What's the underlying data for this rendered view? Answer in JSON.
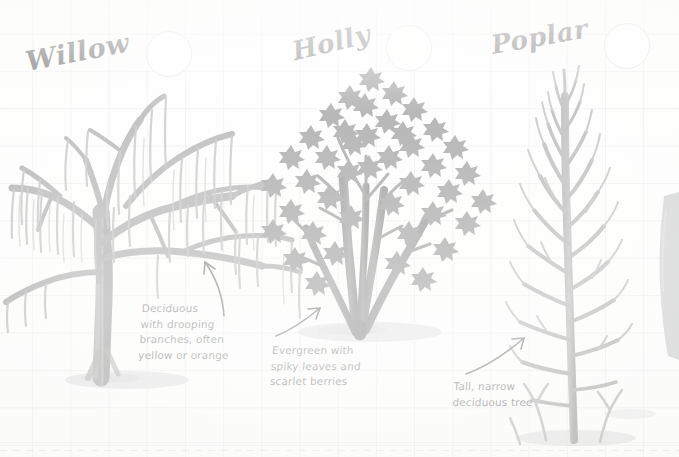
{
  "page": {
    "kind": "illustrated-nature-notebook-page",
    "background": "#fdfdfc",
    "grid_color": "#c8cdcd",
    "ink_color": "#161616"
  },
  "species": [
    {
      "id": "willow",
      "title": "Willow",
      "note": "Deciduous\nwith drooping\nbranches, often\nyellow or orange",
      "tick_circle": "empty",
      "tree_ink": "#6b6b6b",
      "shadow_color": "#c9cccb"
    },
    {
      "id": "holly",
      "title": "Holly",
      "note": "Evergreen with\nspiky leaves and\nscarlet berries",
      "tick_circle": "empty",
      "tree_ink": "#4d4d4d",
      "shadow_color": "#c9cccb"
    },
    {
      "id": "poplar",
      "title": "Poplar",
      "note": "Tall, narrow\ndeciduous tree",
      "tick_circle": "empty",
      "tree_ink": "#707070",
      "shadow_color": "#c9cccb"
    }
  ]
}
